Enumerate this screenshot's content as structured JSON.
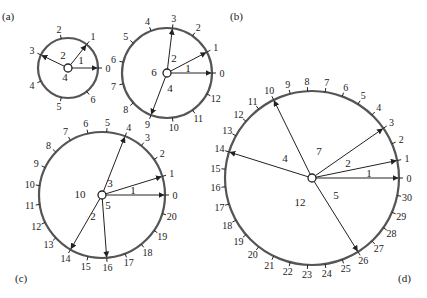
{
  "panels": [
    {
      "id": "a",
      "label": "(a)",
      "label_pos": [
        2,
        20
      ],
      "cx": 68,
      "cy": 68,
      "r": 30,
      "n": 7,
      "font": 10,
      "arrows": [
        0,
        1,
        3
      ],
      "sector_labels": [
        {
          "text": "1",
          "x": 81,
          "y": 64
        },
        {
          "text": "2",
          "x": 63,
          "y": 59
        },
        {
          "text": "4",
          "x": 65,
          "y": 81
        }
      ]
    },
    {
      "id": "b",
      "label": "(b)",
      "label_pos": [
        230,
        20
      ],
      "cx": 167,
      "cy": 73,
      "r": 45,
      "n": 13,
      "font": 10,
      "arrows": [
        0,
        1,
        3,
        9
      ],
      "sector_labels": [
        {
          "text": "1",
          "x": 188,
          "y": 72
        },
        {
          "text": "2",
          "x": 174,
          "y": 62
        },
        {
          "text": "6",
          "x": 154,
          "y": 76
        },
        {
          "text": "4",
          "x": 170,
          "y": 92
        }
      ]
    },
    {
      "id": "c",
      "label": "(c)",
      "label_pos": [
        15,
        282
      ],
      "cx": 102,
      "cy": 195,
      "r": 63,
      "n": 21,
      "font": 10,
      "arrows": [
        0,
        1,
        4,
        14,
        16
      ],
      "sector_labels": [
        {
          "text": "1",
          "x": 133,
          "y": 194
        },
        {
          "text": "3",
          "x": 110,
          "y": 187
        },
        {
          "text": "10",
          "x": 80,
          "y": 198
        },
        {
          "text": "5",
          "x": 108,
          "y": 209
        },
        {
          "text": "2",
          "x": 93,
          "y": 220
        }
      ]
    },
    {
      "id": "d",
      "label": "(d)",
      "label_pos": [
        398,
        282
      ],
      "cx": 312,
      "cy": 178,
      "r": 87,
      "n": 31,
      "font": 10,
      "arrows": [
        0,
        1,
        3,
        10,
        14,
        26
      ],
      "sector_labels": [
        {
          "text": "1",
          "x": 369,
          "y": 177
        },
        {
          "text": "2",
          "x": 348,
          "y": 167
        },
        {
          "text": "7",
          "x": 319,
          "y": 155
        },
        {
          "text": "4",
          "x": 285,
          "y": 162
        },
        {
          "text": "12",
          "x": 300,
          "y": 206
        },
        {
          "text": "5",
          "x": 336,
          "y": 199
        }
      ]
    }
  ],
  "colors": {
    "circle": "#555555",
    "line": "#222222",
    "text": "#222222"
  }
}
